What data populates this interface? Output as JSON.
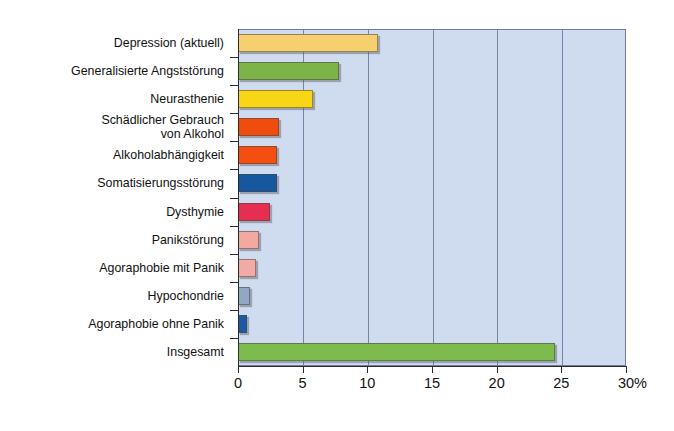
{
  "chart_data": {
    "type": "bar",
    "orientation": "horizontal",
    "title": "",
    "xlabel": "%",
    "ylabel": "",
    "xlim": [
      0,
      30
    ],
    "xticks": [
      0,
      5,
      10,
      15,
      20,
      25,
      30
    ],
    "xtick_labels": [
      "0",
      "5",
      "10",
      "15",
      "20",
      "25",
      "30"
    ],
    "unit_suffix": "%",
    "grid": "vertical",
    "legend": "none",
    "categories": [
      "Depression (aktuell)",
      "Generalisierte Angststörung",
      "Neurasthenie",
      "Schädlicher Gebrauch\nvon Alkohol",
      "Alkoholabhängigkeit",
      "Somatisierungsstörung",
      "Dysthymie",
      "Panikstörung",
      "Agoraphobie mit Panik",
      "Hypochondrie",
      "Agoraphobie ohne Panik",
      "Insgesamt"
    ],
    "values": [
      10.8,
      7.8,
      5.8,
      3.2,
      3.0,
      3.0,
      2.5,
      1.6,
      1.4,
      0.9,
      0.7,
      24.5
    ],
    "bar_colors": [
      "#f6cf6e",
      "#7cb44a",
      "#f8d616",
      "#f04c10",
      "#f44f11",
      "#16579f",
      "#e52e52",
      "#f2a9a2",
      "#f3aaa4",
      "#93a6c4",
      "#1c5ba4",
      "#7cbb4c"
    ],
    "plot_background": "#cfdcf0",
    "gridline_color": "#7286a6",
    "axis_color": "#2b2b2b"
  }
}
